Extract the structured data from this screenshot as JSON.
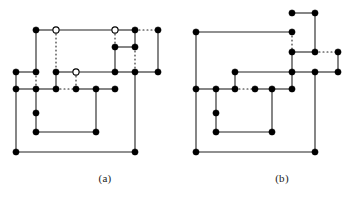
{
  "figure": {
    "type": "line-diagram",
    "colors": {
      "edge_solid": "#222222",
      "edge_dotted": "#222222",
      "vertex_filled": "#000000",
      "vertex_hollow_fill": "#ffffff",
      "vertex_hollow_stroke": "#000000",
      "background": "#ffffff",
      "caption_text": "#1a1a1a"
    },
    "style": {
      "edge_width": 1.1,
      "vertex_radius_filled": 3.1,
      "vertex_radius_hollow": 3.1,
      "dash_pattern": "1,3"
    },
    "captions": [
      {
        "id": "a",
        "label": "(a)"
      },
      {
        "id": "b",
        "label": "(b)"
      }
    ]
  },
  "panel_a": {
    "label": "(a)",
    "vertices": [
      {
        "id": "a1",
        "x": 36,
        "y": 30,
        "fill": "solid"
      },
      {
        "id": "a2",
        "x": 56,
        "y": 30,
        "fill": "hollow"
      },
      {
        "id": "a3",
        "x": 115,
        "y": 30,
        "fill": "hollow"
      },
      {
        "id": "a4",
        "x": 135,
        "y": 30,
        "fill": "solid"
      },
      {
        "id": "a5",
        "x": 158,
        "y": 30,
        "fill": "solid"
      },
      {
        "id": "a6",
        "x": 115,
        "y": 47,
        "fill": "solid"
      },
      {
        "id": "a7",
        "x": 135,
        "y": 47,
        "fill": "solid"
      },
      {
        "id": "a8",
        "x": 16,
        "y": 72,
        "fill": "solid"
      },
      {
        "id": "a9",
        "x": 36,
        "y": 72,
        "fill": "solid"
      },
      {
        "id": "a10",
        "x": 56,
        "y": 72,
        "fill": "solid"
      },
      {
        "id": "a11",
        "x": 76,
        "y": 72,
        "fill": "hollow"
      },
      {
        "id": "a12",
        "x": 115,
        "y": 72,
        "fill": "solid"
      },
      {
        "id": "a13",
        "x": 135,
        "y": 72,
        "fill": "solid"
      },
      {
        "id": "a14",
        "x": 158,
        "y": 72,
        "fill": "solid"
      },
      {
        "id": "a15",
        "x": 16,
        "y": 89,
        "fill": "solid"
      },
      {
        "id": "a16",
        "x": 36,
        "y": 89,
        "fill": "solid"
      },
      {
        "id": "a17",
        "x": 56,
        "y": 89,
        "fill": "solid"
      },
      {
        "id": "a18",
        "x": 76,
        "y": 89,
        "fill": "solid"
      },
      {
        "id": "a19",
        "x": 96,
        "y": 89,
        "fill": "solid"
      },
      {
        "id": "a20",
        "x": 115,
        "y": 89,
        "fill": "solid"
      },
      {
        "id": "a21",
        "x": 36,
        "y": 113,
        "fill": "solid"
      },
      {
        "id": "a22",
        "x": 36,
        "y": 132,
        "fill": "solid"
      },
      {
        "id": "a23",
        "x": 96,
        "y": 132,
        "fill": "solid"
      },
      {
        "id": "a24",
        "x": 16,
        "y": 152,
        "fill": "solid"
      },
      {
        "id": "a25",
        "x": 135,
        "y": 152,
        "fill": "solid"
      }
    ],
    "edges_solid": [
      {
        "x1": 36,
        "y1": 30,
        "x2": 56,
        "y2": 30
      },
      {
        "x1": 56,
        "y1": 30,
        "x2": 115,
        "y2": 30
      },
      {
        "x1": 115,
        "y1": 30,
        "x2": 135,
        "y2": 30
      },
      {
        "x1": 36,
        "y1": 30,
        "x2": 36,
        "y2": 72
      },
      {
        "x1": 135,
        "y1": 30,
        "x2": 135,
        "y2": 47
      },
      {
        "x1": 158,
        "y1": 30,
        "x2": 158,
        "y2": 72
      },
      {
        "x1": 115,
        "y1": 47,
        "x2": 135,
        "y2": 47
      },
      {
        "x1": 115,
        "y1": 47,
        "x2": 115,
        "y2": 72
      },
      {
        "x1": 16,
        "y1": 72,
        "x2": 36,
        "y2": 72
      },
      {
        "x1": 56,
        "y1": 72,
        "x2": 76,
        "y2": 72
      },
      {
        "x1": 76,
        "y1": 72,
        "x2": 115,
        "y2": 72
      },
      {
        "x1": 115,
        "y1": 72,
        "x2": 135,
        "y2": 72
      },
      {
        "x1": 135,
        "y1": 72,
        "x2": 158,
        "y2": 72
      },
      {
        "x1": 16,
        "y1": 72,
        "x2": 16,
        "y2": 89
      },
      {
        "x1": 56,
        "y1": 72,
        "x2": 56,
        "y2": 89
      },
      {
        "x1": 16,
        "y1": 89,
        "x2": 36,
        "y2": 89
      },
      {
        "x1": 36,
        "y1": 89,
        "x2": 56,
        "y2": 89
      },
      {
        "x1": 76,
        "y1": 89,
        "x2": 96,
        "y2": 89
      },
      {
        "x1": 96,
        "y1": 89,
        "x2": 115,
        "y2": 89
      },
      {
        "x1": 36,
        "y1": 89,
        "x2": 36,
        "y2": 113
      },
      {
        "x1": 36,
        "y1": 113,
        "x2": 36,
        "y2": 132
      },
      {
        "x1": 96,
        "y1": 89,
        "x2": 96,
        "y2": 132
      },
      {
        "x1": 36,
        "y1": 132,
        "x2": 96,
        "y2": 132
      },
      {
        "x1": 16,
        "y1": 89,
        "x2": 16,
        "y2": 152
      },
      {
        "x1": 16,
        "y1": 152,
        "x2": 135,
        "y2": 152
      },
      {
        "x1": 135,
        "y1": 72,
        "x2": 135,
        "y2": 152
      }
    ],
    "edges_dotted": [
      {
        "x1": 56,
        "y1": 30,
        "x2": 56,
        "y2": 72
      },
      {
        "x1": 115,
        "y1": 30,
        "x2": 115,
        "y2": 47
      },
      {
        "x1": 135,
        "y1": 30,
        "x2": 158,
        "y2": 30
      },
      {
        "x1": 135,
        "y1": 47,
        "x2": 135,
        "y2": 72
      },
      {
        "x1": 36,
        "y1": 72,
        "x2": 36,
        "y2": 89
      },
      {
        "x1": 76,
        "y1": 72,
        "x2": 76,
        "y2": 89
      },
      {
        "x1": 56,
        "y1": 89,
        "x2": 76,
        "y2": 89
      }
    ]
  },
  "panel_b": {
    "label": "(b)",
    "vertices": [
      {
        "id": "b1",
        "x": 292,
        "y": 13,
        "fill": "solid"
      },
      {
        "id": "b2",
        "x": 315,
        "y": 13,
        "fill": "solid"
      },
      {
        "id": "b3",
        "x": 196,
        "y": 32,
        "fill": "solid"
      },
      {
        "id": "b4",
        "x": 292,
        "y": 32,
        "fill": "solid"
      },
      {
        "id": "b5",
        "x": 292,
        "y": 52,
        "fill": "solid"
      },
      {
        "id": "b6",
        "x": 315,
        "y": 52,
        "fill": "solid"
      },
      {
        "id": "b7",
        "x": 338,
        "y": 52,
        "fill": "solid"
      },
      {
        "id": "b8",
        "x": 235,
        "y": 72,
        "fill": "solid"
      },
      {
        "id": "b9",
        "x": 292,
        "y": 72,
        "fill": "solid"
      },
      {
        "id": "b10",
        "x": 315,
        "y": 72,
        "fill": "solid"
      },
      {
        "id": "b11",
        "x": 338,
        "y": 72,
        "fill": "solid"
      },
      {
        "id": "b12",
        "x": 196,
        "y": 89,
        "fill": "solid"
      },
      {
        "id": "b13",
        "x": 216,
        "y": 89,
        "fill": "solid"
      },
      {
        "id": "b14",
        "x": 235,
        "y": 89,
        "fill": "solid"
      },
      {
        "id": "b15",
        "x": 255,
        "y": 89,
        "fill": "solid"
      },
      {
        "id": "b16",
        "x": 272,
        "y": 89,
        "fill": "solid"
      },
      {
        "id": "b17",
        "x": 292,
        "y": 89,
        "fill": "solid"
      },
      {
        "id": "b18",
        "x": 216,
        "y": 113,
        "fill": "solid"
      },
      {
        "id": "b19",
        "x": 216,
        "y": 132,
        "fill": "solid"
      },
      {
        "id": "b20",
        "x": 272,
        "y": 132,
        "fill": "solid"
      },
      {
        "id": "b21",
        "x": 196,
        "y": 152,
        "fill": "solid"
      },
      {
        "id": "b22",
        "x": 315,
        "y": 152,
        "fill": "solid"
      }
    ],
    "edges_solid": [
      {
        "x1": 292,
        "y1": 13,
        "x2": 315,
        "y2": 13
      },
      {
        "x1": 315,
        "y1": 13,
        "x2": 315,
        "y2": 52
      },
      {
        "x1": 196,
        "y1": 32,
        "x2": 292,
        "y2": 32
      },
      {
        "x1": 292,
        "y1": 52,
        "x2": 315,
        "y2": 52
      },
      {
        "x1": 292,
        "y1": 52,
        "x2": 292,
        "y2": 72
      },
      {
        "x1": 338,
        "y1": 52,
        "x2": 338,
        "y2": 72
      },
      {
        "x1": 235,
        "y1": 72,
        "x2": 292,
        "y2": 72
      },
      {
        "x1": 292,
        "y1": 72,
        "x2": 315,
        "y2": 72
      },
      {
        "x1": 315,
        "y1": 72,
        "x2": 338,
        "y2": 72
      },
      {
        "x1": 235,
        "y1": 72,
        "x2": 235,
        "y2": 89
      },
      {
        "x1": 196,
        "y1": 89,
        "x2": 216,
        "y2": 89
      },
      {
        "x1": 216,
        "y1": 89,
        "x2": 235,
        "y2": 89
      },
      {
        "x1": 255,
        "y1": 89,
        "x2": 272,
        "y2": 89
      },
      {
        "x1": 272,
        "y1": 89,
        "x2": 292,
        "y2": 89
      },
      {
        "x1": 292,
        "y1": 72,
        "x2": 292,
        "y2": 89
      },
      {
        "x1": 216,
        "y1": 89,
        "x2": 216,
        "y2": 113
      },
      {
        "x1": 216,
        "y1": 113,
        "x2": 216,
        "y2": 132
      },
      {
        "x1": 272,
        "y1": 89,
        "x2": 272,
        "y2": 132
      },
      {
        "x1": 216,
        "y1": 132,
        "x2": 272,
        "y2": 132
      },
      {
        "x1": 196,
        "y1": 32,
        "x2": 196,
        "y2": 89
      },
      {
        "x1": 196,
        "y1": 89,
        "x2": 196,
        "y2": 152
      },
      {
        "x1": 196,
        "y1": 152,
        "x2": 315,
        "y2": 152
      },
      {
        "x1": 315,
        "y1": 72,
        "x2": 315,
        "y2": 152
      }
    ],
    "edges_dotted": [
      {
        "x1": 292,
        "y1": 32,
        "x2": 292,
        "y2": 52
      },
      {
        "x1": 315,
        "y1": 52,
        "x2": 338,
        "y2": 52
      },
      {
        "x1": 235,
        "y1": 89,
        "x2": 255,
        "y2": 89
      }
    ]
  }
}
